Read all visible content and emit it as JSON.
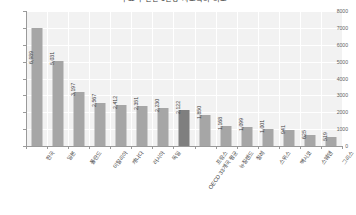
{
  "chart_data": {
    "type": "bar",
    "title": "주요국 연간 1인당 사교육비 비교",
    "xlabel": "",
    "ylabel": "",
    "ylim": [
      0,
      8000
    ],
    "yticks": [
      0,
      1000,
      2000,
      3000,
      4000,
      5000,
      6000,
      7000,
      8000
    ],
    "ytick_labels": [
      "0",
      "1000",
      "2000",
      "3000",
      "4000",
      "5000",
      "6000",
      "7000",
      "8000"
    ],
    "grid": true,
    "legend": "none",
    "bar_color": "#a6a6a6",
    "highlight_color": "#7f7f7f",
    "plot_background": "#f2f2f2",
    "highlight_index": 7,
    "categories": [
      "한국",
      "일본",
      "폴란드",
      "이탈리아",
      "캐나다",
      "러시아",
      "독일",
      "OECD 33개국 평균",
      "프랑스",
      "뉴질랜드",
      "칠레",
      "스위스",
      "멕시코",
      "스웨덴",
      "그리스"
    ],
    "values": [
      6989,
      5031,
      3197,
      2567,
      2412,
      2351,
      2230,
      2122,
      1850,
      1168,
      1099,
      1001,
      941,
      625,
      519
    ],
    "value_labels": [
      "6,989",
      "5,031",
      "3,197",
      "2,567",
      "2,412",
      "2,351",
      "2,230",
      "2,122",
      "1,850",
      "1,168",
      "1,099",
      "1,001",
      "941",
      "625",
      "519"
    ]
  }
}
